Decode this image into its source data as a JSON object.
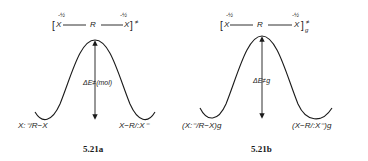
{
  "diagrams": [
    {
      "id": "5.21a",
      "caption": "5.21a",
      "transition_state": {
        "open_bracket": "[",
        "left_atom": "X",
        "left_charge": "-½",
        "center_atom": "R",
        "right_atom": "X",
        "right_charge": "-½",
        "close_bracket": "]",
        "superscript": "≠",
        "subscript": ""
      },
      "barrier_label": "ΔE≠(mol)",
      "left_state": "X:⁻/R−X",
      "right_state": "X−R/:X⁻"
    },
    {
      "id": "5.21b",
      "caption": "5.21b",
      "transition_state": {
        "open_bracket": "[",
        "left_atom": "X",
        "left_charge": "-½",
        "center_atom": "R",
        "right_atom": "X",
        "right_charge": "-½",
        "close_bracket": "]",
        "superscript": "≠",
        "subscript": "g"
      },
      "barrier_label": "ΔE≠g",
      "left_state": "(X:⁻/R−X)g",
      "right_state": "(X−R/:X⁻)g"
    }
  ],
  "colors": {
    "ink": "#1a1a1a",
    "background": "#ffffff"
  }
}
